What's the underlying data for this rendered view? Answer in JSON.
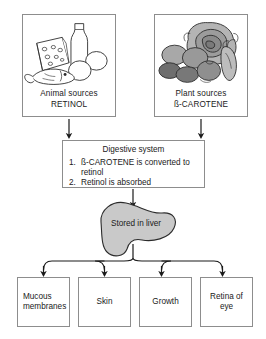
{
  "diagram": {
    "sources": [
      {
        "id": "animal",
        "caption_line1": "Animal sources",
        "caption_line2": "RETINOL",
        "art_name": "animal-foods-illustration",
        "art_items": [
          "cheese-wedge",
          "milk-bottle",
          "egg",
          "egg",
          "fish"
        ]
      },
      {
        "id": "plant",
        "caption_line1": "Plant sources",
        "caption_line2": "ß-CAROTENE",
        "art_name": "plant-foods-illustration",
        "art_items": [
          "cabbage",
          "carrot",
          "potato",
          "potato",
          "tomato",
          "beetroot"
        ]
      }
    ],
    "digestive": {
      "title": "Digestive system",
      "steps": [
        {
          "num": "1.",
          "text": "ß-CAROTENE is converted to retinol"
        },
        {
          "num": "2.",
          "text": "Retinol is absorbed"
        }
      ]
    },
    "storage": {
      "label": "Stored in liver",
      "shape_name": "liver-blob",
      "fill": "#c9c9c9",
      "stroke": "#2b2b2b"
    },
    "outcomes": [
      {
        "id": "mucous",
        "label": "Mucous membranes"
      },
      {
        "id": "skin",
        "label": "Skin"
      },
      {
        "id": "growth",
        "label": "Growth"
      },
      {
        "id": "retina",
        "label": "Retina of eye"
      }
    ],
    "colors": {
      "box_border": "#8d8d8d",
      "arrow": "#1a1a1a",
      "background": "#ffffff",
      "text": "#1a1a1a"
    }
  }
}
